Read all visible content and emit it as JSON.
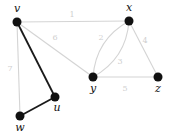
{
  "graph": {
    "nodes": [
      {
        "id": "v",
        "label": "v",
        "x": 17,
        "y": 22,
        "lx": 17,
        "ly": 12
      },
      {
        "id": "x",
        "label": "x",
        "x": 129,
        "y": 21,
        "lx": 129,
        "ly": 11
      },
      {
        "id": "y",
        "label": "y",
        "x": 93,
        "y": 77,
        "lx": 93,
        "ly": 92
      },
      {
        "id": "z",
        "label": "z",
        "x": 158,
        "y": 77,
        "lx": 158,
        "ly": 92
      },
      {
        "id": "u",
        "label": "u",
        "x": 55,
        "y": 97,
        "lx": 57,
        "ly": 111
      },
      {
        "id": "w",
        "label": "w",
        "x": 20,
        "y": 116,
        "lx": 20,
        "ly": 131
      }
    ],
    "edges": [
      {
        "from": "v",
        "to": "x",
        "weight": "1",
        "style": "light",
        "lx": 72,
        "ly": 17
      },
      {
        "from": "v",
        "to": "y",
        "weight": "6",
        "style": "light",
        "lx": 55,
        "ly": 40
      },
      {
        "from": "v",
        "to": "u",
        "weight": "",
        "style": "bold"
      },
      {
        "from": "v",
        "to": "w",
        "weight": "7",
        "style": "light",
        "lx": 10,
        "ly": 71
      },
      {
        "from": "u",
        "to": "w",
        "weight": "",
        "style": "bold"
      },
      {
        "from": "x",
        "to": "y",
        "weight": "2",
        "style": "light",
        "curve": "left",
        "lx": 101,
        "ly": 40
      },
      {
        "from": "x",
        "to": "y",
        "weight": "3",
        "style": "light",
        "curve": "right",
        "lx": 120,
        "ly": 64
      },
      {
        "from": "x",
        "to": "z",
        "weight": "4",
        "style": "light",
        "lx": 145,
        "ly": 43
      },
      {
        "from": "y",
        "to": "z",
        "weight": "5",
        "style": "light",
        "lx": 125,
        "ly": 91
      }
    ],
    "colors": {
      "node": "#111111",
      "bold_edge": "#1a1a1a",
      "light_edge": "#d4d4d4",
      "edge_label": "#cfcfcf"
    }
  }
}
